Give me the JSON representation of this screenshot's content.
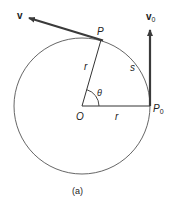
{
  "diagram": {
    "caption": "(a)",
    "labels": {
      "v": "v",
      "v0_main": "v",
      "v0_sub": "0",
      "P": "P",
      "P0_main": "P",
      "P0_sub": "0",
      "O": "O",
      "r_radius_to_P": "r",
      "r_radius_to_P0": "r",
      "s": "s",
      "theta": "θ"
    },
    "colors": {
      "stroke": "#333333",
      "circle": "#555555",
      "arrow": "#3a3a3a"
    }
  }
}
